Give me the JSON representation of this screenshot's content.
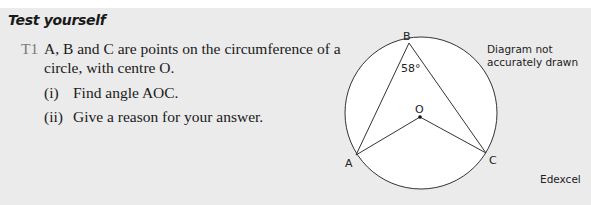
{
  "heading": "Test yourself",
  "question": {
    "number": "T1",
    "lines": [
      "A, B and C are points on the circumference of a",
      "circle, with centre O."
    ],
    "parts": [
      {
        "label": "(i)",
        "text": "Find angle AOC."
      },
      {
        "label": "(ii)",
        "text": "Give a reason for your answer."
      }
    ]
  },
  "diagram": {
    "points": {
      "A": "A",
      "B": "B",
      "C": "C",
      "O": "O"
    },
    "angle_label": "58°",
    "note_line1": "Diagram not",
    "note_line2": "accurately drawn"
  },
  "source": "Edexcel"
}
